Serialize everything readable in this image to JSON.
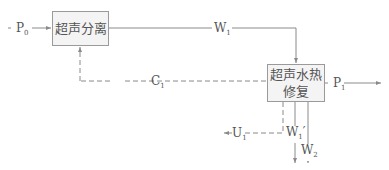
{
  "diagram": {
    "type": "process-flow",
    "nodes": [
      {
        "id": "separation",
        "label": "超声分离"
      },
      {
        "id": "repair",
        "label_line1": "超声水热",
        "label_line2": "修复"
      }
    ],
    "flows": {
      "P0": {
        "main": "P",
        "sub": "0"
      },
      "W1": {
        "main": "W",
        "sub": "1"
      },
      "C1": {
        "main": "C",
        "sub": "1"
      },
      "P1": {
        "main": "P",
        "sub": "1"
      },
      "U1": {
        "main": "U",
        "sub": "1"
      },
      "W1p": {
        "main": "W",
        "sub": "1",
        "prime": "′"
      },
      "W2": {
        "main": "W",
        "sub": "2"
      }
    },
    "colors": {
      "line": "#8a8a8a",
      "box_fill": "#f4f4f4",
      "box_border": "#9a9a9a",
      "text": "#555555"
    }
  }
}
